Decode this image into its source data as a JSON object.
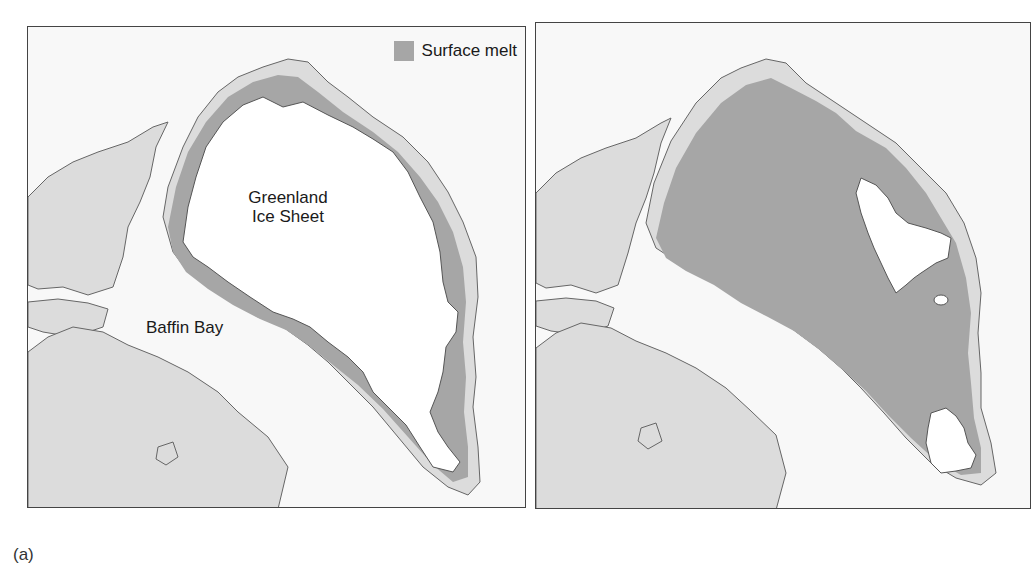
{
  "colors": {
    "ocean": "#f8f8f8",
    "land": "#dcdcdc",
    "surface_melt": "#a6a6a6",
    "ice_sheet": "#ffffff",
    "coastline": "#666666",
    "border": "#444444"
  },
  "panels": [
    {
      "id": "left",
      "legend": {
        "label": "Surface melt",
        "swatch_color": "#a6a6a6"
      },
      "labels": {
        "greenland_line1": "Greenland",
        "greenland_line2": "Ice Sheet",
        "baffin": "Baffin Bay"
      },
      "description": "Limited surface melt around the ice sheet margins"
    },
    {
      "id": "right",
      "description": "Extensive surface melt covering most of the ice sheet"
    }
  ],
  "caption": "(a)"
}
